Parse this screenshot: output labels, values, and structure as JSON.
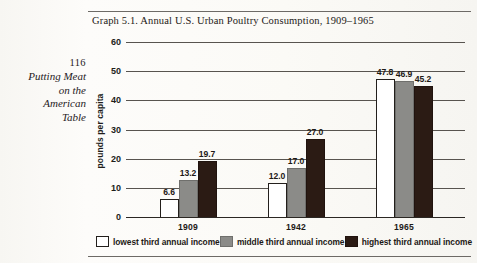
{
  "page": {
    "folio": "116",
    "running_head_lines": [
      "Putting Meat",
      "on the",
      "American",
      "Table"
    ]
  },
  "chart_data": {
    "type": "bar",
    "title": "Graph 5.1. Annual U.S. Urban Poultry Consumption, 1909–1965",
    "xlabel": "",
    "ylabel": "pounds per capita",
    "ylim": [
      0,
      60
    ],
    "yticks": [
      0,
      10,
      20,
      30,
      40,
      50,
      60
    ],
    "ytick_labels": [
      "0",
      "10",
      "20",
      "30",
      "40",
      "50",
      "60"
    ],
    "categories": [
      "1909",
      "1942",
      "1965"
    ],
    "grid": true,
    "legend_position": "bottom",
    "series": [
      {
        "name": "lowest third annual income",
        "color": "#ffffff",
        "values": [
          6.6,
          12.0,
          47.8
        ],
        "labels": [
          "6.6",
          "12.0",
          "47.8"
        ]
      },
      {
        "name": "middle third annual income",
        "color": "#8b8b88",
        "values": [
          13.2,
          17.0,
          46.9
        ],
        "labels": [
          "13.2",
          "17.0",
          "46.9"
        ]
      },
      {
        "name": "highest third annual income",
        "color": "#2b1b14",
        "values": [
          19.7,
          27.0,
          45.2
        ],
        "labels": [
          "19.7",
          "27.0",
          "45.2"
        ]
      }
    ]
  }
}
